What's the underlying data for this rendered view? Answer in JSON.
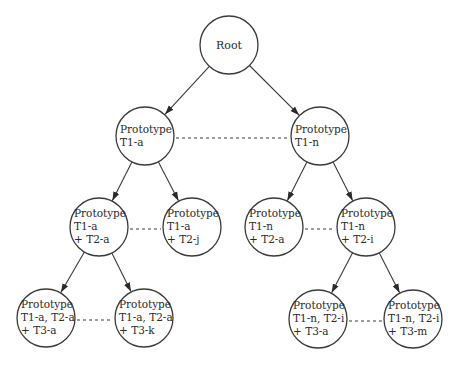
{
  "diagram": {
    "type": "tree",
    "nodes": [
      {
        "id": "root",
        "lines": [
          "Root"
        ],
        "cx": 229,
        "cy": 45
      },
      {
        "id": "t1a",
        "lines": [
          "Prototype",
          "T1-a"
        ],
        "cx": 145,
        "cy": 136
      },
      {
        "id": "t1n",
        "lines": [
          "Prototype",
          "T1-n"
        ],
        "cx": 320,
        "cy": 136
      },
      {
        "id": "t1a_t2a",
        "lines": [
          "Prototype",
          "T1-a",
          "+ T2-a"
        ],
        "cx": 99,
        "cy": 227
      },
      {
        "id": "t1a_t2j",
        "lines": [
          "Prototype",
          "T1-a",
          "+ T2-j"
        ],
        "cx": 192,
        "cy": 227
      },
      {
        "id": "t1n_t2a",
        "lines": [
          "Prototype",
          "T1-n",
          "+ T2-a"
        ],
        "cx": 274,
        "cy": 227
      },
      {
        "id": "t1n_t2i",
        "lines": [
          "Prototype",
          "T1-n",
          "+ T2-i"
        ],
        "cx": 366,
        "cy": 227
      },
      {
        "id": "t1a_t2a_t3a",
        "lines": [
          "Prototype",
          "T1-a, T2-a",
          "+ T3-a"
        ],
        "cx": 46,
        "cy": 318
      },
      {
        "id": "t1a_t2a_t3k",
        "lines": [
          "Prototype",
          "T1-a, T2-a",
          "+ T3-k"
        ],
        "cx": 144,
        "cy": 318
      },
      {
        "id": "t1n_t2i_t3a",
        "lines": [
          "Prototype",
          "T1-n, T2-i",
          "+ T3-a"
        ],
        "cx": 318,
        "cy": 319
      },
      {
        "id": "t1n_t2i_t3m",
        "lines": [
          "Prototype",
          "T1-n, T2-i",
          "+ T3-m"
        ],
        "cx": 413,
        "cy": 319
      }
    ],
    "edges": [
      {
        "from": "root",
        "to": "t1a"
      },
      {
        "from": "root",
        "to": "t1n"
      },
      {
        "from": "t1a",
        "to": "t1a_t2a"
      },
      {
        "from": "t1a",
        "to": "t1a_t2j"
      },
      {
        "from": "t1n",
        "to": "t1n_t2a"
      },
      {
        "from": "t1n",
        "to": "t1n_t2i"
      },
      {
        "from": "t1a_t2a",
        "to": "t1a_t2a_t3a"
      },
      {
        "from": "t1a_t2a",
        "to": "t1a_t2a_t3k"
      },
      {
        "from": "t1n_t2i",
        "to": "t1n_t2i_t3a"
      },
      {
        "from": "t1n_t2i",
        "to": "t1n_t2i_t3m"
      }
    ],
    "sibling_links": [
      {
        "a": "t1a",
        "b": "t1n"
      },
      {
        "a": "t1a_t2a",
        "b": "t1a_t2j"
      },
      {
        "a": "t1n_t2a",
        "b": "t1n_t2i"
      },
      {
        "a": "t1a_t2a_t3a",
        "b": "t1a_t2a_t3k"
      },
      {
        "a": "t1n_t2i_t3a",
        "b": "t1n_t2i_t3m"
      }
    ],
    "node_radius": 29,
    "colors": {
      "stroke": "#3a3a3a",
      "fill": "#ffffff",
      "text": "#2a2a2a"
    }
  }
}
